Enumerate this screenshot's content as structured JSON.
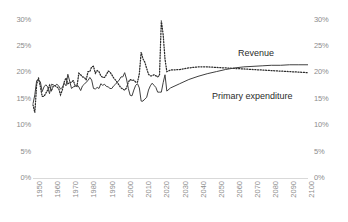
{
  "chart_data": {
    "type": "line",
    "title": "",
    "subtitle": "",
    "xlabel": "",
    "ylabel": "",
    "xlim": [
      1950,
      2100
    ],
    "ylim": [
      0,
      0.3
    ],
    "ylim_percent": [
      0,
      30
    ],
    "grid": false,
    "legend_position": "inline-annotations",
    "y_tick_labels_left": [
      "30%",
      "25%",
      "20%",
      "15%",
      "10%",
      "5%",
      "0%"
    ],
    "y_tick_labels_right": [
      "30%",
      "25%",
      "20%",
      "15%",
      "10%",
      "5%",
      "0%"
    ],
    "y_tick_values": [
      30,
      25,
      20,
      15,
      10,
      5,
      0
    ],
    "x_tick_labels": [
      "1950",
      "1960",
      "1970",
      "1980",
      "1990",
      "2000",
      "2010",
      "2020",
      "2030",
      "2040",
      "2050",
      "2060",
      "2070",
      "2080",
      "2090",
      "2100"
    ],
    "x_tick_values": [
      1950,
      1960,
      1970,
      1980,
      1990,
      2000,
      2010,
      2020,
      2030,
      2040,
      2050,
      2060,
      2070,
      2080,
      2090,
      2100
    ],
    "annotations": [
      {
        "text": "Revenue",
        "x": 2042,
        "y": 24.0
      },
      {
        "text": "Primary expenditure",
        "x": 2034,
        "y": 16.8
      }
    ],
    "series": [
      {
        "name": "Revenue",
        "style": "solid",
        "color": "#404040",
        "x": [
          1950,
          1951,
          1952,
          1953,
          1954,
          1955,
          1956,
          1957,
          1958,
          1959,
          1960,
          1961,
          1962,
          1963,
          1964,
          1965,
          1966,
          1967,
          1968,
          1969,
          1970,
          1971,
          1972,
          1973,
          1974,
          1975,
          1976,
          1977,
          1978,
          1979,
          1980,
          1981,
          1982,
          1983,
          1984,
          1985,
          1986,
          1987,
          1988,
          1989,
          1990,
          1991,
          1992,
          1993,
          1994,
          1995,
          1996,
          1997,
          1998,
          1999,
          2000,
          2001,
          2002,
          2003,
          2004,
          2005,
          2006,
          2007,
          2008,
          2009,
          2010,
          2011,
          2012,
          2013,
          2014,
          2015,
          2016,
          2017,
          2018,
          2019,
          2020,
          2021,
          2022,
          2023,
          2025,
          2030,
          2035,
          2040,
          2045,
          2050,
          2055,
          2060,
          2065,
          2070,
          2075,
          2080,
          2085,
          2090,
          2095,
          2100
        ],
        "values": [
          14.1,
          15.8,
          18.5,
          18.6,
          18.3,
          16.4,
          17.3,
          17.7,
          17.3,
          16.0,
          17.8,
          17.7,
          17.5,
          17.8,
          17.5,
          16.9,
          17.2,
          18.0,
          17.5,
          19.7,
          18.4,
          17.0,
          17.3,
          17.4,
          17.7,
          17.3,
          16.6,
          17.5,
          17.8,
          18.2,
          18.5,
          19.1,
          18.6,
          17.0,
          16.9,
          17.2,
          17.0,
          17.9,
          17.6,
          17.8,
          17.4,
          17.3,
          17.0,
          17.0,
          17.5,
          17.8,
          18.2,
          18.6,
          19.2,
          19.2,
          20.0,
          18.8,
          17.0,
          15.7,
          15.6,
          16.7,
          17.6,
          17.9,
          17.1,
          14.6,
          14.6,
          15.0,
          15.3,
          16.7,
          17.5,
          18.0,
          17.6,
          17.2,
          16.3,
          16.3,
          16.3,
          18.1,
          19.6,
          16.5,
          17.1,
          17.9,
          18.7,
          19.3,
          19.8,
          20.2,
          20.6,
          20.9,
          21.1,
          21.2,
          21.3,
          21.4,
          21.4,
          21.5,
          21.5,
          21.5
        ]
      },
      {
        "name": "Primary expenditure",
        "style": "dotted",
        "color": "#2b2b2b",
        "x": [
          1950,
          1951,
          1952,
          1953,
          1954,
          1955,
          1956,
          1957,
          1958,
          1959,
          1960,
          1961,
          1962,
          1963,
          1964,
          1965,
          1966,
          1967,
          1968,
          1969,
          1970,
          1971,
          1972,
          1973,
          1974,
          1975,
          1976,
          1977,
          1978,
          1979,
          1980,
          1981,
          1982,
          1983,
          1984,
          1985,
          1986,
          1987,
          1988,
          1989,
          1990,
          1991,
          1992,
          1993,
          1994,
          1995,
          1996,
          1997,
          1998,
          1999,
          2000,
          2001,
          2002,
          2003,
          2004,
          2005,
          2006,
          2007,
          2008,
          2009,
          2010,
          2011,
          2012,
          2013,
          2014,
          2015,
          2016,
          2017,
          2018,
          2019,
          2020,
          2021,
          2022,
          2023,
          2025,
          2030,
          2035,
          2040,
          2045,
          2050,
          2055,
          2060,
          2065,
          2070,
          2075,
          2080,
          2085,
          2090,
          2095,
          2100
        ],
        "values": [
          13.9,
          12.4,
          17.8,
          19.0,
          17.4,
          15.5,
          15.5,
          16.1,
          16.7,
          17.6,
          16.5,
          17.4,
          17.5,
          17.3,
          17.0,
          15.8,
          16.7,
          18.2,
          19.0,
          17.9,
          18.1,
          18.2,
          18.5,
          17.5,
          17.4,
          19.9,
          19.6,
          19.2,
          19.1,
          18.6,
          20.2,
          20.2,
          21.1,
          21.2,
          19.9,
          20.4,
          20.2,
          19.4,
          19.1,
          19.1,
          19.6,
          20.3,
          20.1,
          19.6,
          19.0,
          18.6,
          18.1,
          17.6,
          17.1,
          16.9,
          16.7,
          17.1,
          18.2,
          18.7,
          18.5,
          18.6,
          18.2,
          18.2,
          19.8,
          23.9,
          22.6,
          22.0,
          20.8,
          19.7,
          19.4,
          19.4,
          19.6,
          19.4,
          19.2,
          19.5,
          29.9,
          27.2,
          22.6,
          20.2,
          20.5,
          20.6,
          20.9,
          21.1,
          21.1,
          21.0,
          20.9,
          20.8,
          20.7,
          20.6,
          20.5,
          20.4,
          20.3,
          20.2,
          20.1,
          20.0
        ]
      }
    ]
  }
}
